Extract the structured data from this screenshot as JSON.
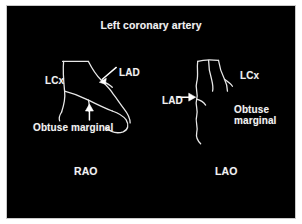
{
  "figure": {
    "title": "Left coronary artery",
    "background_color": "#000000",
    "line_color": "#e8e8e8",
    "text_color": "#f2f2f2",
    "border_color": "#c9c9c9"
  },
  "panels": [
    {
      "view": "RAO",
      "view_label": "RAO",
      "labels": {
        "lcx": "LCx",
        "lad": "LAD",
        "obtuse_marginal": "Obtuse marginal"
      },
      "arrows": [
        {
          "name": "lad-arrow",
          "direction": "down-left"
        },
        {
          "name": "obtuse-marginal-arrow",
          "direction": "up"
        }
      ]
    },
    {
      "view": "LAO",
      "view_label": "LAO",
      "labels": {
        "lad": "LAD",
        "lcx": "LCx",
        "obtuse_marginal_line1": "Obtuse",
        "obtuse_marginal_line2": "marginal"
      },
      "arrows": [
        {
          "name": "lad-arrow",
          "direction": "right"
        }
      ]
    }
  ]
}
